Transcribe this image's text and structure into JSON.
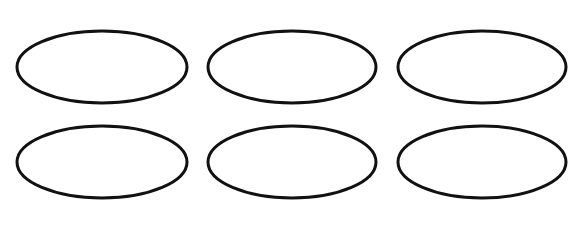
{
  "diagram": {
    "canvas": {
      "width": 584,
      "height": 231,
      "background": "#ffffff"
    },
    "stroke_color": "#111111",
    "stroke_width": 3,
    "fill": "none",
    "grid": {
      "rows": 2,
      "columns": 3
    },
    "ellipses": [
      {
        "row": 1,
        "col": 1,
        "cx": 102,
        "cy": 67,
        "rx": 85,
        "ry": 36
      },
      {
        "row": 1,
        "col": 2,
        "cx": 292,
        "cy": 67,
        "rx": 84,
        "ry": 36
      },
      {
        "row": 1,
        "col": 3,
        "cx": 482,
        "cy": 67,
        "rx": 84,
        "ry": 36
      },
      {
        "row": 2,
        "col": 1,
        "cx": 102,
        "cy": 162,
        "rx": 85,
        "ry": 36
      },
      {
        "row": 2,
        "col": 2,
        "cx": 292,
        "cy": 162,
        "rx": 84,
        "ry": 36
      },
      {
        "row": 2,
        "col": 3,
        "cx": 482,
        "cy": 162,
        "rx": 84,
        "ry": 36
      }
    ]
  }
}
